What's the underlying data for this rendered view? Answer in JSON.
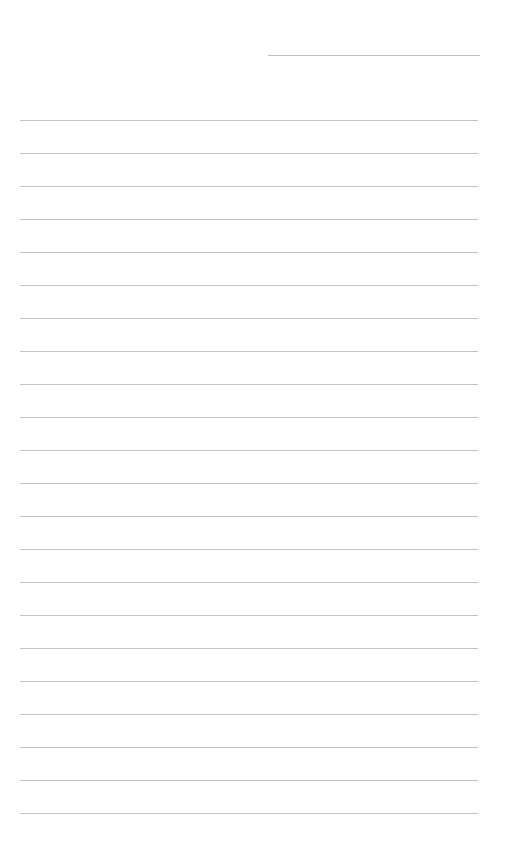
{
  "page": {
    "type": "lined-notepaper",
    "background_color": "#ffffff",
    "line_color": "#c4c4c4",
    "date_line": {
      "label": ""
    },
    "ruled_lines": {
      "count": 22,
      "spacing_px": 33
    }
  }
}
